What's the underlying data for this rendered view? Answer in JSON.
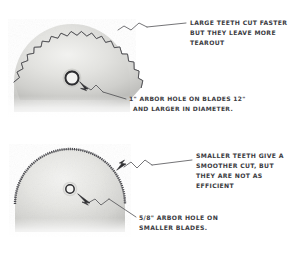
{
  "figure": {
    "medium": "pencil sketch",
    "background_color": "#ffffff",
    "ink_color": "#3b3b3f",
    "blade_body_color": "#d8d8d6"
  },
  "annotations": {
    "large_teeth": {
      "name": "large-teeth-note",
      "lines": [
        "LARGE TEETH CUT FASTER",
        "BUT THEY LEAVE MORE",
        "TEAROUT"
      ]
    },
    "large_arbor": {
      "name": "large-arbor-note",
      "lines": [
        "1\" ARBOR HOLE ON  BLADES 12\"",
        "AND LARGER IN DIAMETER."
      ]
    },
    "small_teeth": {
      "name": "small-teeth-note",
      "lines": [
        "SMALLER TEETH GIVE A",
        "SMOOTHER CUT, BUT",
        "THEY ARE NOT AS",
        "EFFICIENT"
      ]
    },
    "small_arbor": {
      "name": "small-arbor-note",
      "lines": [
        "5/8\" ARBOR HOLE ON",
        "SMALLER BLADES."
      ]
    }
  },
  "blades": {
    "top": {
      "label": "coarse-tooth-blade",
      "tooth_count": 26,
      "tooth_size": "large",
      "arbor_hole": "1 inch",
      "center_x": 72,
      "center_y": 78,
      "radius": 58
    },
    "bottom": {
      "label": "fine-tooth-blade",
      "tooth_count": 72,
      "tooth_size": "small",
      "arbor_hole": "5/8 inch",
      "center_x": 70,
      "center_y": 202,
      "radius": 55
    }
  }
}
